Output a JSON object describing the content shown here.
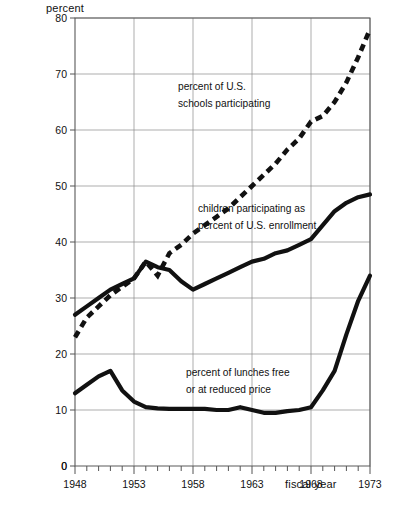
{
  "chart_data": {
    "type": "line",
    "title": "",
    "xlabel": "fiscal year",
    "ylabel": "percent",
    "xlim": [
      1948,
      1973
    ],
    "ylim": [
      0,
      80
    ],
    "grid": true,
    "legend_position": "inline-annotations",
    "x_ticks": [
      "1948",
      "1953",
      "1958",
      "1963",
      "1968",
      "1973"
    ],
    "y_ticks": [
      "0",
      "10",
      "20",
      "30",
      "40",
      "50",
      "60",
      "70",
      "80"
    ],
    "x": [
      1948,
      1949,
      1950,
      1951,
      1952,
      1953,
      1954,
      1955,
      1956,
      1957,
      1958,
      1959,
      1960,
      1961,
      1962,
      1963,
      1964,
      1965,
      1966,
      1967,
      1968,
      1969,
      1970,
      1971,
      1972,
      1973
    ],
    "series": [
      {
        "name": "percent of U.S. schools participating",
        "style": "dashed",
        "values": [
          23.0,
          26.5,
          28.5,
          30.5,
          32.0,
          33.5,
          36.5,
          34.0,
          38.0,
          39.5,
          41.5,
          43.0,
          44.5,
          46.0,
          48.0,
          50.0,
          52.0,
          54.0,
          56.5,
          58.5,
          61.5,
          62.5,
          65.0,
          68.5,
          73.0,
          78.0
        ]
      },
      {
        "name": "children participating as percent of U.S. enrollment",
        "style": "solid",
        "values": [
          27.0,
          28.5,
          30.0,
          31.5,
          32.5,
          33.5,
          36.5,
          35.5,
          35.0,
          33.0,
          31.5,
          32.5,
          33.5,
          34.5,
          35.5,
          36.5,
          37.0,
          38.0,
          38.5,
          39.5,
          40.5,
          43.0,
          45.5,
          47.0,
          48.0,
          48.5
        ]
      },
      {
        "name": "percent of lunches free or at reduced price",
        "style": "solid",
        "values": [
          13.0,
          14.5,
          16.0,
          17.0,
          13.5,
          11.5,
          10.5,
          10.3,
          10.2,
          10.2,
          10.2,
          10.2,
          10.0,
          10.0,
          10.5,
          10.0,
          9.5,
          9.5,
          9.8,
          10.0,
          10.5,
          13.5,
          17.0,
          23.5,
          29.5,
          34.0
        ]
      }
    ],
    "annotations": [
      {
        "id": "annot-schools",
        "line1": "percent of U.S.",
        "line2": "schools participating"
      },
      {
        "id": "annot-children",
        "line1": "children participating as",
        "line2": "percent of U.S. enrollment"
      },
      {
        "id": "annot-freelunch",
        "line1": "percent of lunches free",
        "line2": "or at reduced price"
      }
    ],
    "caption": ""
  }
}
